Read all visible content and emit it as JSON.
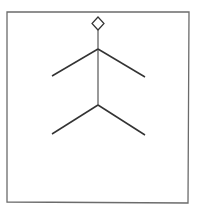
{
  "diagram": {
    "type": "line-figure",
    "colors": {
      "background": "#ffffff",
      "frame": "#6b6b6b",
      "stroke": "#333333"
    },
    "frame": {
      "x1": 7,
      "y1": 12,
      "x2": 189,
      "y2": 12,
      "x3": 188,
      "y3": 203,
      "x4": 7,
      "y4": 202
    },
    "diamond": {
      "top": [
        98,
        17
      ],
      "right": [
        104,
        23.5
      ],
      "bottom": [
        98,
        30
      ],
      "left": [
        92,
        23.5
      ]
    },
    "spine": {
      "from": [
        98,
        30
      ],
      "to": [
        98,
        105
      ]
    },
    "upper_branches": {
      "junction": [
        98,
        49
      ],
      "left_end": [
        52,
        76
      ],
      "right_end": [
        145,
        77
      ]
    },
    "lower_branches": {
      "junction": [
        98,
        105
      ],
      "left_end": [
        52,
        134
      ],
      "right_end": [
        145,
        135
      ]
    }
  }
}
